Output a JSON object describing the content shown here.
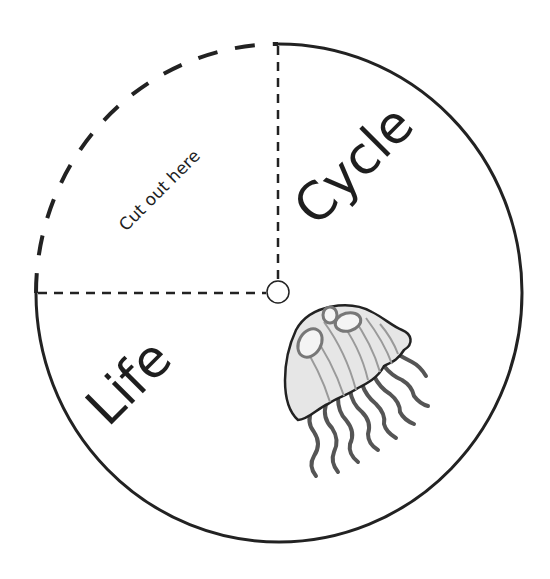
{
  "wheel": {
    "words": {
      "left": "Life",
      "right": "Cycle"
    },
    "cut_label": "Cut out here",
    "image": "jellyfish",
    "colors": {
      "line": "#222222",
      "jelly_fill": "#e6e6e6",
      "jelly_shade": "#9a9a9a",
      "tentacle": "#555555"
    }
  }
}
